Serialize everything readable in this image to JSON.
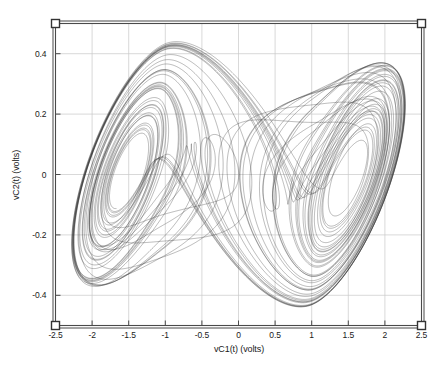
{
  "chart_data": {
    "type": "line",
    "title": "",
    "subtitle": "",
    "xlabel": "vC1(t) (volts)",
    "ylabel": "vC2(t) (volts)",
    "xlim": [
      -2.5,
      2.5
    ],
    "ylim": [
      -0.5,
      0.5
    ],
    "xticks": [
      -2.5,
      -2,
      -1.5,
      -1,
      -0.5,
      0,
      0.5,
      1,
      1.5,
      2,
      2.5
    ],
    "xtick_labels": [
      "-2.5",
      "-2",
      "-1.5",
      "-1",
      "-0.5",
      "0",
      "0.5",
      "1",
      "1.5",
      "2",
      "2.5"
    ],
    "yticks": [
      0.4,
      0.2,
      0,
      -0.2,
      -0.4
    ],
    "ytick_labels": [
      "0.4",
      "0.2",
      "0",
      "-0.2",
      "-0.4"
    ],
    "grid": true,
    "legend": null,
    "legend_position": "none",
    "series": [
      {
        "name": "Chua double-scroll attractor trajectory",
        "kind": "phase-portrait",
        "color": "#2b2b2b",
        "line_width": 0.38,
        "description": "Dense chaotic orbit forming two interlinked scrolls",
        "left_scroll_center": [
          -1.58,
          -0.02
        ],
        "right_scroll_center": [
          1.55,
          -0.02
        ],
        "x_extent": [
          -2.28,
          2.3
        ],
        "y_extent": [
          -0.44,
          0.44
        ]
      }
    ],
    "model": {
      "name": "Chua circuit (dimensionless)",
      "alpha": 9.35,
      "beta": 14.79,
      "m0": -1.1384,
      "m1": -0.7225,
      "x_scale": 2.28,
      "y_scale": 0.44,
      "dt": 0.0035,
      "steps": 54000,
      "transient": 2400,
      "x0": 0.12,
      "y0": 0.02,
      "z0": -0.08
    }
  },
  "axes": {
    "frame_color": "#4a4a4a",
    "grid_color": "#c8c8c8",
    "background": "#ffffff",
    "handles": [
      "top-left",
      "top-right",
      "bottom-left",
      "bottom-right"
    ]
  }
}
